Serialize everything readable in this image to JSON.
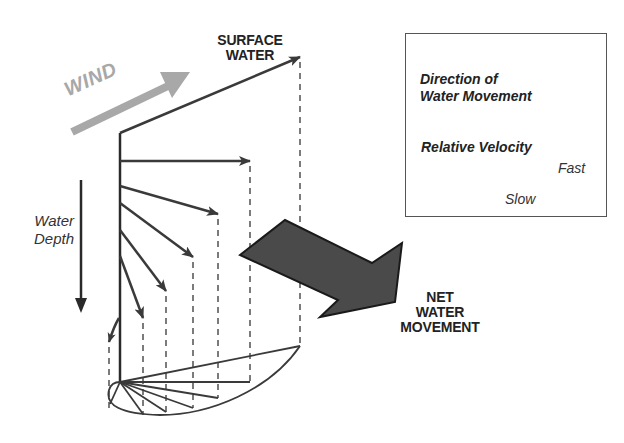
{
  "diagram": {
    "type": "ekman-spiral",
    "labels": {
      "wind": "WIND",
      "surface_water_line1": "SURFACE",
      "surface_water_line2": "WATER",
      "water_depth_line1": "Water",
      "water_depth_line2": "Depth",
      "net_movement_line1": "NET",
      "net_movement_line2": "WATER",
      "net_movement_line3": "MOVEMENT"
    },
    "legend": {
      "direction_title_line1": "Direction of",
      "direction_title_line2": "Water Movement",
      "velocity_title": "Relative Velocity",
      "fast_label": "Fast",
      "slow_label": "Slow"
    },
    "colors": {
      "arrow": "#3a3a3a",
      "wind_arrow": "#a8a8a8",
      "net_arrow_fill": "#4a4a4a",
      "legend_border": "#555555",
      "text": "#222222"
    },
    "vectors": [
      {
        "depth_index": 0,
        "label": "surface",
        "from": [
          120,
          133
        ],
        "to": [
          300,
          57
        ]
      },
      {
        "depth_index": 1,
        "from": [
          120,
          161
        ],
        "to": [
          250,
          161
        ]
      },
      {
        "depth_index": 2,
        "from": [
          120,
          186
        ],
        "to": [
          218,
          214
        ]
      },
      {
        "depth_index": 3,
        "from": [
          120,
          203
        ],
        "to": [
          193,
          257
        ]
      },
      {
        "depth_index": 4,
        "from": [
          120,
          230
        ],
        "to": [
          166,
          291
        ]
      },
      {
        "depth_index": 5,
        "from": [
          120,
          256
        ],
        "to": [
          143,
          318
        ]
      },
      {
        "depth_index": 6,
        "from": [
          114,
          322
        ],
        "to": [
          108,
          342
        ]
      }
    ]
  }
}
